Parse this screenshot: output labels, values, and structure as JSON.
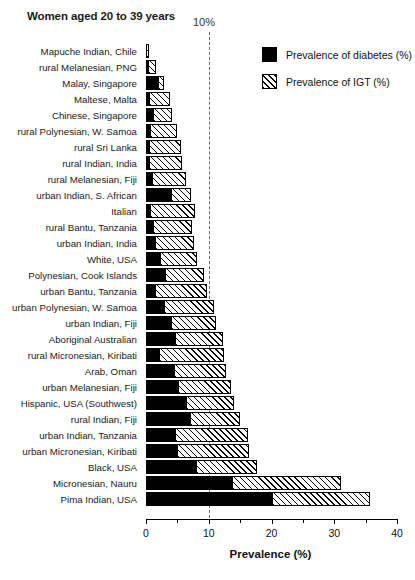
{
  "chart_data": {
    "type": "bar",
    "orientation": "horizontal",
    "stacked": true,
    "title": "Women aged 20 to 39 years",
    "xlabel": "Prevalence (%)",
    "ylabel": "",
    "xlim": [
      0,
      40
    ],
    "xticks": [
      0,
      10,
      20,
      30,
      40
    ],
    "xtick_labels": [
      "0",
      "10",
      "20",
      "30",
      "40"
    ],
    "minor_ticks": [
      5,
      15,
      25,
      35
    ],
    "grid": false,
    "annotations": [
      {
        "label": "10%",
        "x": 10,
        "style": "vertical dashed reference line"
      }
    ],
    "legend": {
      "position": "top-right",
      "entries": [
        {
          "name": "Prevalence of diabetes (%)",
          "swatch": "solid-black"
        },
        {
          "name": "Prevalence of IGT (%)",
          "swatch": "hatched-diagonal"
        }
      ]
    },
    "categories": [
      "Mapuche Indian, Chile",
      "rural Melanesian, PNG",
      "Malay, Singapore",
      "Maltese, Malta",
      "Chinese, Singapore",
      "rural Polynesian, W. Samoa",
      "rural Sri Lanka",
      "rural Indian, India",
      "rural Melanesian, Fiji",
      "urban Indian, S. African",
      "Italian",
      "rural Bantu, Tanzania",
      "urban Indian, India",
      "White, USA",
      "Polynesian, Cook Islands",
      "urban Bantu, Tanzania",
      "urban Polynesian, W. Samoa",
      "urban Indian, Fiji",
      "Aboriginal Australian",
      "rural Micronesian, Kiribati",
      "Arab, Oman",
      "urban Melanesian, Fiji",
      "Hispanic, USA (Southwest)",
      "rural Indian, Fiji",
      "urban Indian, Tanzania",
      "urban Micronesian, Kiribati",
      "Black, USA",
      "Micronesian, Nauru",
      "Pima Indian, USA"
    ],
    "series": [
      {
        "name": "Prevalence of diabetes (%)",
        "values": [
          0.0,
          0.2,
          1.9,
          0.4,
          1.1,
          0.6,
          0.5,
          0.5,
          1.0,
          4.0,
          0.6,
          1.1,
          1.5,
          2.2,
          3.0,
          1.5,
          2.8,
          4.0,
          4.6,
          2.0,
          4.4,
          5.1,
          6.4,
          7.0,
          4.6,
          5.0,
          8.0,
          13.7,
          20.0
        ]
      },
      {
        "name": "Prevalence of IGT (%)",
        "values": [
          0.4,
          1.3,
          0.9,
          3.4,
          3.1,
          4.4,
          5.0,
          5.3,
          5.3,
          3.1,
          7.2,
          6.3,
          6.2,
          6.0,
          6.3,
          8.2,
          8.0,
          7.1,
          7.6,
          10.5,
          8.4,
          8.4,
          7.6,
          8.0,
          11.6,
          11.4,
          9.7,
          17.3,
          15.7
        ]
      }
    ],
    "totals": [
      0.4,
      1.5,
      2.8,
      3.8,
      4.2,
      5.0,
      5.5,
      5.8,
      6.3,
      7.1,
      7.8,
      7.4,
      7.7,
      8.2,
      9.3,
      9.7,
      10.8,
      11.1,
      12.2,
      12.5,
      12.8,
      13.5,
      14.0,
      15.0,
      16.2,
      16.4,
      17.7,
      31.0,
      35.7
    ]
  }
}
